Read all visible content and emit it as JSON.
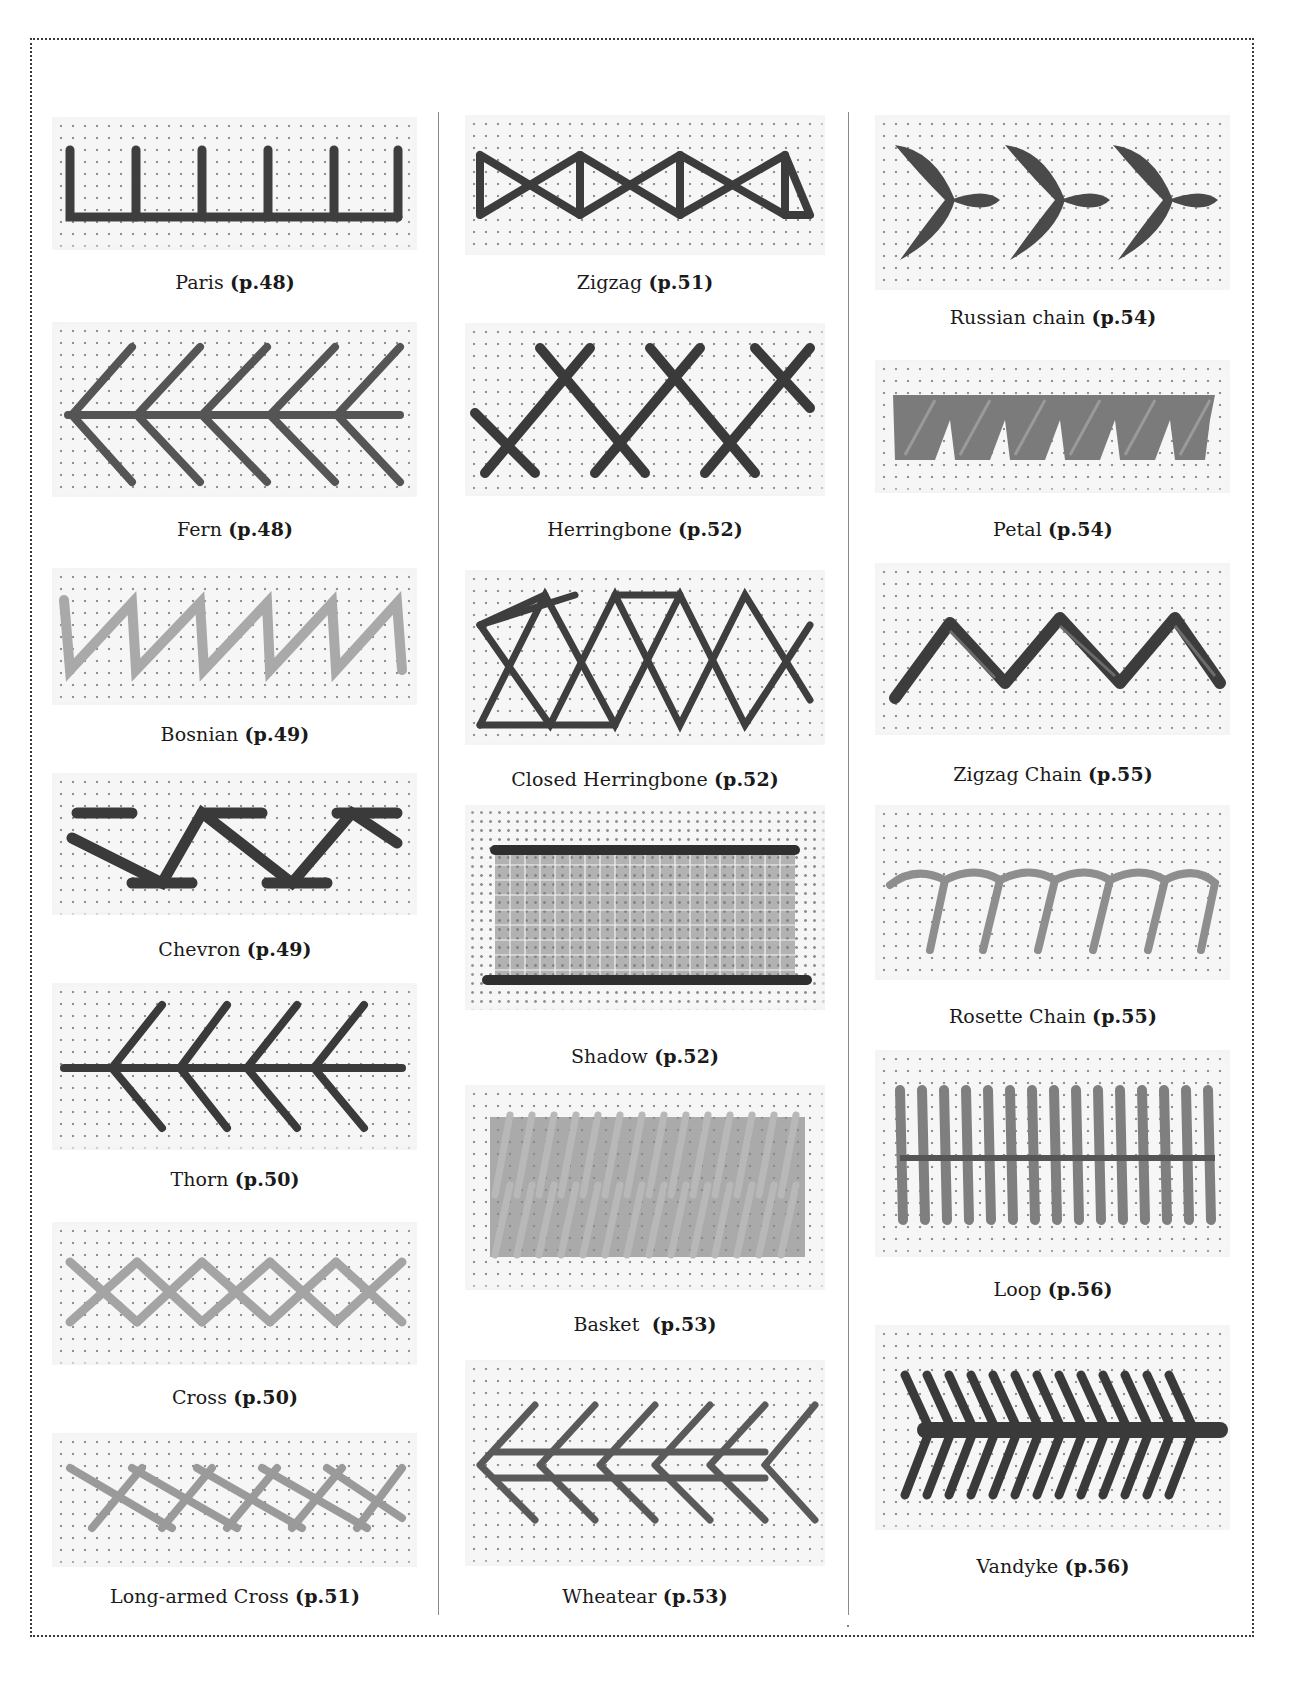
{
  "colors": {
    "thread_dark": "#3c3c3c",
    "thread_mid": "#6e6e6e",
    "thread_light": "#a8a8a8",
    "fabric": "#f6f6f6",
    "frame": "#3a3a3a"
  },
  "columns": [
    {
      "stitches": [
        {
          "name": "Paris",
          "page": "(p.48)",
          "icon": "paris-stitch-sample"
        },
        {
          "name": "Fern",
          "page": "(p.48)",
          "icon": "fern-stitch-sample"
        },
        {
          "name": "Bosnian",
          "page": "(p.49)",
          "icon": "bosnian-stitch-sample"
        },
        {
          "name": "Chevron",
          "page": "(p.49)",
          "icon": "chevron-stitch-sample"
        },
        {
          "name": "Thorn",
          "page": "(p.50)",
          "icon": "thorn-stitch-sample"
        },
        {
          "name": "Cross",
          "page": "(p.50)",
          "icon": "cross-stitch-sample"
        },
        {
          "name": "Long-armed Cross",
          "page": "(p.51)",
          "icon": "long-armed-cross-stitch-sample"
        }
      ]
    },
    {
      "stitches": [
        {
          "name": "Zigzag",
          "page": "(p.51)",
          "icon": "zigzag-stitch-sample"
        },
        {
          "name": "Herringbone",
          "page": "(p.52)",
          "icon": "herringbone-stitch-sample"
        },
        {
          "name": "Closed Herringbone",
          "page": "(p.52)",
          "icon": "closed-herringbone-stitch-sample"
        },
        {
          "name": "Shadow",
          "page": "(p.52)",
          "icon": "shadow-stitch-sample"
        },
        {
          "name": "Basket ",
          "page": "(p.53)",
          "icon": "basket-stitch-sample"
        },
        {
          "name": "Wheatear",
          "page": "(p.53)",
          "icon": "wheatear-stitch-sample"
        }
      ]
    },
    {
      "stitches": [
        {
          "name": "Russian chain",
          "page": "(p.54)",
          "icon": "russian-chain-stitch-sample"
        },
        {
          "name": "Petal",
          "page": "(p.54)",
          "icon": "petal-stitch-sample"
        },
        {
          "name": "Zigzag Chain",
          "page": "(p.55)",
          "icon": "zigzag-chain-stitch-sample"
        },
        {
          "name": "Rosette Chain",
          "page": "(p.55)",
          "icon": "rosette-chain-stitch-sample"
        },
        {
          "name": "Loop",
          "page": "(p.56)",
          "icon": "loop-stitch-sample"
        },
        {
          "name": "Vandyke",
          "page": "(p.56)",
          "icon": "vandyke-stitch-sample"
        }
      ]
    }
  ]
}
